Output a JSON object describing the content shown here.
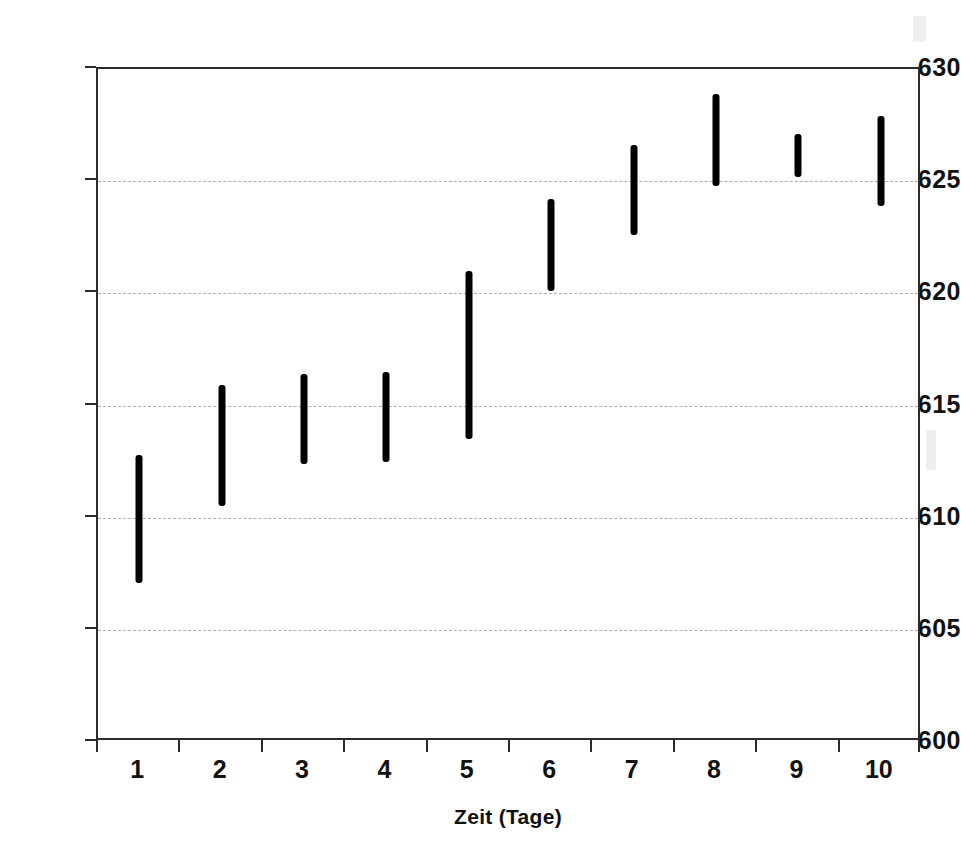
{
  "chart_data": {
    "type": "bar",
    "title": "",
    "subtitle": "",
    "xlabel": "Zeit (Tage)",
    "ylabel": "",
    "categories": [
      "1",
      "2",
      "3",
      "4",
      "5",
      "6",
      "7",
      "8",
      "9",
      "10"
    ],
    "x": [
      1,
      2,
      3,
      4,
      5,
      6,
      7,
      8,
      9,
      10
    ],
    "series": [
      {
        "name": "Messbereich",
        "type": "range",
        "low": [
          607.1,
          610.5,
          612.4,
          612.5,
          613.5,
          620.1,
          622.6,
          624.8,
          625.2,
          623.9
        ],
        "high": [
          612.8,
          615.9,
          616.4,
          616.5,
          621.0,
          624.2,
          626.6,
          628.9,
          627.1,
          627.9
        ]
      }
    ],
    "ylim": [
      600,
      630
    ],
    "yticks": [
      600,
      605,
      610,
      615,
      620,
      625,
      630
    ],
    "ytick_labels": [
      "600",
      "605",
      "610",
      "615",
      "620",
      "625",
      "630"
    ],
    "xlim": [
      0.5,
      10.5
    ],
    "grid": "horizontal-dashed",
    "legend": "none",
    "bar_color": "#000000",
    "grid_color": "#aeaeae",
    "axis_color": "#2b2b2b"
  }
}
